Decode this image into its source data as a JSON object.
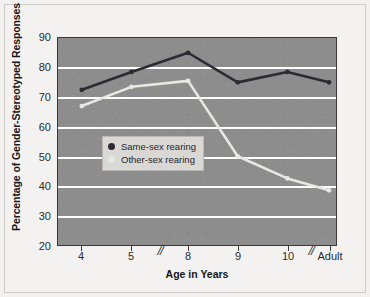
{
  "chart_data": {
    "type": "line",
    "title": "",
    "xlabel": "Age in Years",
    "ylabel": "Percentage of Gender-Stereotyped Responses",
    "categories": [
      "4",
      "5",
      "8",
      "9",
      "10",
      "Adult"
    ],
    "xtick_labels": [
      "4",
      "5",
      "8",
      "9",
      "10",
      "Adult"
    ],
    "axis_breaks": [
      "between 5 and 8",
      "between 10 and Adult"
    ],
    "ylim": [
      20,
      90
    ],
    "yticks": [
      20,
      30,
      40,
      50,
      60,
      70,
      80,
      90
    ],
    "ytick_labels": [
      "20",
      "30",
      "40",
      "50",
      "60",
      "70",
      "80",
      "90"
    ],
    "grid": "horizontal",
    "gridlines": [
      30,
      40,
      50,
      60,
      70,
      80
    ],
    "legend_position": "center-left",
    "series": [
      {
        "name": "Same-sex rearing",
        "color": "#2b2b33",
        "values": [
          72.5,
          78.5,
          85.0,
          75.0,
          78.5,
          75.0
        ]
      },
      {
        "name": "Other-sex rearing",
        "color": "#e8e7e3",
        "values": [
          67.0,
          73.5,
          75.5,
          50.0,
          42.5,
          38.5
        ]
      }
    ],
    "plot_background": "#8d8d8d",
    "gridline_color": "#ffffff",
    "page_background": "#f3f2f0"
  },
  "legend": {
    "items": [
      {
        "label": "Same-sex rearing",
        "color": "#2b2b33"
      },
      {
        "label": "Other-sex rearing",
        "color": "#e8e7e3"
      }
    ]
  },
  "axes": {
    "y_title": "Percentage of Gender-Stereotyped Responses",
    "x_title": "Age in Years",
    "y_labels": [
      "90",
      "80",
      "70",
      "60",
      "50",
      "40",
      "30",
      "20"
    ],
    "x_labels": [
      "4",
      "5",
      "8",
      "9",
      "10",
      "Adult"
    ],
    "break_glyph": "//"
  }
}
